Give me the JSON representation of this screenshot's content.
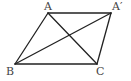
{
  "diagram": {
    "type": "geometry-figure",
    "points": {
      "A": {
        "label": "A",
        "x": 48,
        "y": 13
      },
      "Ap": {
        "label": "A′",
        "x": 111,
        "y": 13
      },
      "B": {
        "label": "B",
        "x": 15,
        "y": 64
      },
      "C": {
        "label": "C",
        "x": 97,
        "y": 64
      }
    },
    "segments": [
      {
        "name": "A-Ap",
        "from": "A",
        "to": "Ap"
      },
      {
        "name": "A-B",
        "from": "A",
        "to": "B"
      },
      {
        "name": "B-C",
        "from": "B",
        "to": "C"
      },
      {
        "name": "C-Ap",
        "from": "C",
        "to": "Ap"
      },
      {
        "name": "A-C",
        "from": "A",
        "to": "C"
      },
      {
        "name": "B-Ap",
        "from": "B",
        "to": "Ap"
      }
    ],
    "colors": {
      "line": "#222222",
      "label": "#444444",
      "background": "#ffffff"
    }
  }
}
